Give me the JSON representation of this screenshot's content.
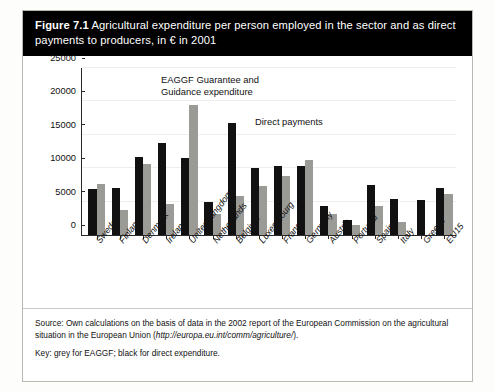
{
  "figure": {
    "number": "Figure 7.1",
    "title": "Agricultural expenditure per person employed in the sector and as direct payments to producers, in € in 2001"
  },
  "annotations": {
    "eaggf_line1": "EAGGF Guarantee and",
    "eaggf_line2": "Guidance expenditure",
    "direct": "Direct payments"
  },
  "footer": {
    "source_part1": "Source: Own calculations on the basis of data in the 2002 report of the European Commission on the agricultural situation in the European Union (",
    "source_url": "http://europa.eu.int/comm/agriculture/",
    "source_part2": ").",
    "key": "Key: grey for EAGGF; black for direct expenditure."
  },
  "colors": {
    "direct_payments": "#111111",
    "eaggf": "#9a9a97",
    "title_bar_bg": "#000000",
    "title_bar_text": "#ffffff"
  },
  "chart_data": {
    "type": "bar",
    "title": "Agricultural expenditure per person employed in the sector and as direct payments to producers, in € in 2001",
    "xlabel": "",
    "ylabel": "",
    "ylim": [
      0,
      25000
    ],
    "yticks": [
      0,
      5000,
      10000,
      15000,
      20000,
      25000
    ],
    "ytick_labels": [
      "0",
      "5000",
      "10000",
      "15000",
      "20000",
      "25000"
    ],
    "grid": false,
    "legend_position": "annotations-inline",
    "categories": [
      "Sweden",
      "Finland",
      "Denmark",
      "Ireland",
      "United Kingdom",
      "Netherlands",
      "Belgium",
      "Luxembourg",
      "France",
      "Germany",
      "Austria",
      "Portugal",
      "Spain",
      "Italy",
      "Greece",
      "EU15"
    ],
    "series": [
      {
        "name": "Direct payments",
        "color": "#111111",
        "values": [
          6900,
          7000,
          11700,
          13700,
          11500,
          4900,
          16800,
          10000,
          10400,
          10400,
          4400,
          2200,
          7500,
          5400,
          5300,
          7000
        ]
      },
      {
        "name": "EAGGF Guarantee and Guidance expenditure",
        "color": "#9a9a97",
        "values": [
          7700,
          3700,
          10700,
          4700,
          19400,
          3200,
          5800,
          7400,
          8900,
          11200,
          3100,
          1500,
          4400,
          2000,
          0,
          6200
        ]
      }
    ]
  }
}
